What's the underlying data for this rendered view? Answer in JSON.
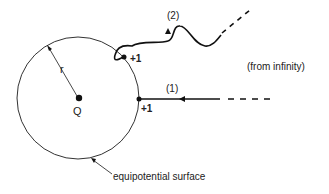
{
  "diagram": {
    "colors": {
      "ink": "#1a1a1a",
      "background": "#ffffff"
    },
    "circle": {
      "cx": 78,
      "cy": 98,
      "r": 61
    },
    "labels": {
      "radius": "r",
      "charge": "Q",
      "path2": "(2)",
      "path1": "(1)",
      "charge_path2": "+1",
      "charge_path1": "+1",
      "from_infinity": "(from infinity)",
      "surface": "equipotential surface"
    }
  }
}
